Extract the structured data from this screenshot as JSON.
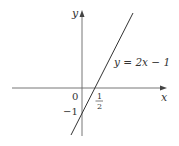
{
  "figure": {
    "type": "line-graph",
    "axes": {
      "x_label": "x",
      "y_label": "y",
      "origin_label": "0"
    },
    "line": {
      "equation_label": "y = 2x − 1",
      "slope": 2,
      "intercept": -1
    },
    "annotations": {
      "y_intercept_label": "−1",
      "x_intercept_numerator": "1",
      "x_intercept_denominator": "2"
    },
    "colors": {
      "axis": "#555555",
      "line": "#333333",
      "text": "#333333"
    }
  }
}
